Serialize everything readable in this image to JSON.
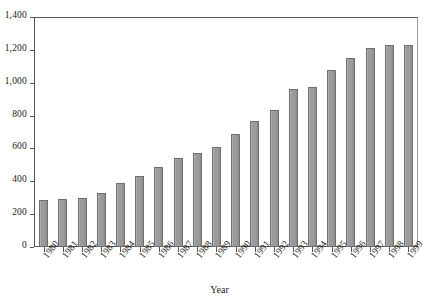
{
  "chart_data": {
    "type": "bar",
    "title": "",
    "subtitle": "",
    "xlabel": "Year",
    "ylabel": "",
    "categories": [
      "1980",
      "1981",
      "1982",
      "1983",
      "1984",
      "1985",
      "1986",
      "1987",
      "1988",
      "1989",
      "1990",
      "1991",
      "1992",
      "1993",
      "1994",
      "1995",
      "1996",
      "1997",
      "1998",
      "1999"
    ],
    "values": [
      285,
      295,
      300,
      330,
      390,
      430,
      490,
      540,
      570,
      610,
      690,
      765,
      835,
      960,
      975,
      1075,
      1150,
      1210,
      1230,
      1230
    ],
    "series": [
      {
        "name": "",
        "values": [
          285,
          295,
          300,
          330,
          390,
          430,
          490,
          540,
          570,
          610,
          690,
          765,
          835,
          960,
          975,
          1075,
          1150,
          1210,
          1230,
          1230
        ]
      }
    ],
    "ylim": [
      0,
      1400
    ],
    "ytick_values": [
      0,
      200,
      400,
      600,
      800,
      1000,
      1200,
      1400
    ],
    "ytick_labels": [
      "0",
      "200",
      "400",
      "600",
      "800",
      "1,000",
      "1,200",
      "1,400"
    ],
    "grid": false,
    "legend": null,
    "legend_position": "none",
    "bar_color": "#9a9a9a",
    "bar_edge_color": "#6d6e70",
    "axis_color": "#55565a",
    "background_color": "#ffffff",
    "xtick_label_rotation": -52
  }
}
